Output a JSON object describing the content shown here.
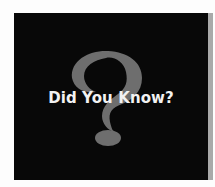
{
  "graphic": {
    "title": "Did You Know?",
    "icon": "question-mark-icon",
    "colors": {
      "background": "#080808",
      "question_mark": "#6e6e6e",
      "text": "#f2f2f2",
      "side_strip": "#a9a9a9"
    }
  }
}
